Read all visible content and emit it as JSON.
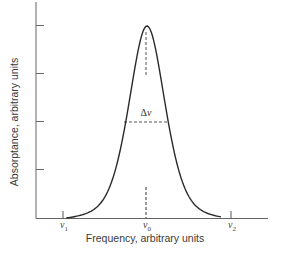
{
  "chart_data": {
    "type": "line",
    "title": "",
    "xlabel": "Frequency, arbitrary units",
    "ylabel": "Absorptance, arbitrary units",
    "x_ticks": [
      {
        "symbol": "ν",
        "sub": "1",
        "label": "ν1",
        "x": 0.0
      },
      {
        "symbol": "ν",
        "sub": "0",
        "label": "ν0",
        "x": 0.5
      },
      {
        "symbol": "ν",
        "sub": "2",
        "label": "ν2",
        "x": 1.0
      }
    ],
    "y_ticks": [
      1,
      2,
      3,
      4
    ],
    "ylim": [
      0,
      4.5
    ],
    "xlim": [
      -0.16,
      1.22
    ],
    "grid": false,
    "legend": null,
    "series": [
      {
        "name": "absorption line",
        "center": 0.5,
        "peak": 4.0,
        "fwhm": 0.26,
        "x": [
          0.02,
          0.1,
          0.2,
          0.3,
          0.35,
          0.4,
          0.43,
          0.46,
          0.5,
          0.54,
          0.57,
          0.6,
          0.65,
          0.7,
          0.8,
          0.9,
          0.94
        ],
        "y": [
          0.0,
          0.1,
          0.4,
          1.2,
          1.9,
          2.9,
          3.4,
          3.85,
          4.0,
          3.85,
          3.4,
          2.9,
          1.9,
          1.2,
          0.4,
          0.1,
          0.0
        ]
      }
    ],
    "annotations": [
      {
        "text": "Δν",
        "type": "full-width-half-maximum",
        "y": 2.0,
        "x_from": 0.37,
        "x_to": 0.63
      },
      {
        "text": "",
        "type": "dashed-center-line",
        "x": 0.5
      }
    ]
  },
  "labels": {
    "ylabel": "Absorptance, arbitrary units",
    "xlabel": "Frequency, arbitrary units",
    "fwhm_symbol": "Δ",
    "fwhm_var": "ν",
    "nu": "ν",
    "nu1_sub": "1",
    "nu0_sub": "0",
    "nu2_sub": "2"
  },
  "style": {
    "line_color": "#2a2a2a",
    "axis_color": "#555555"
  }
}
